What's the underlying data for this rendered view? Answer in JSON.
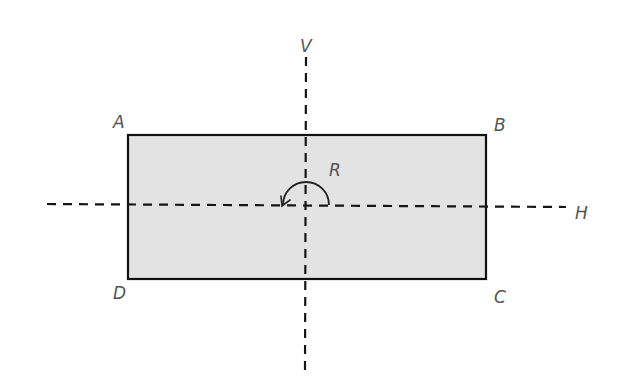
{
  "diagram": {
    "shape": "rectangle",
    "fill_color": "#e3e3e3",
    "stroke_color": "#111111",
    "vertices": {
      "top_left": "A",
      "top_right": "B",
      "bottom_right": "C",
      "bottom_left": "D"
    },
    "axes": {
      "vertical_label": "V",
      "horizontal_label": "H",
      "style": "dashed"
    },
    "rotation": {
      "label": "R",
      "direction": "counter-clockwise",
      "extent": "half-turn"
    }
  }
}
